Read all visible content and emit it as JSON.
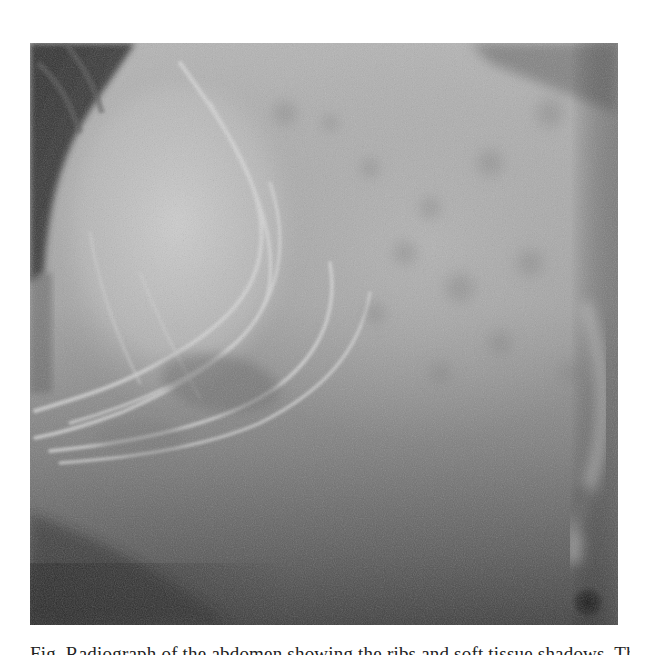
{
  "page": {
    "background": "#ffffff"
  },
  "figure": {
    "type": "grayscale radiograph",
    "bounds": {
      "left": 30,
      "top": 43,
      "right": 618,
      "bottom": 625
    },
    "tones": {
      "dark_corner": "#3a3a3a",
      "bright_lobe": "#c4c4c4",
      "mid_gray": "#a6a6a6",
      "lower_gray": "#6a6a6a",
      "bottom_dark": "#3e3e3e",
      "spot": "#1e1e1e"
    },
    "features": [
      "dark-upper-left-wedge",
      "bright-rounded-lobe-left",
      "curved-rib-arcs",
      "mottled-upper-right-region",
      "darker-lower-band",
      "dark-spot-bottom-right"
    ]
  },
  "caption": {
    "text": "Fig. Radiograph of the abdomen showing the ribs and soft tissue shadows. The small",
    "clipped": true
  }
}
